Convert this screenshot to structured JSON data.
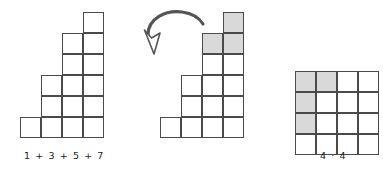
{
  "page": {
    "width": 383,
    "height": 172,
    "background": "#ffffff"
  },
  "style": {
    "cell_size": 21,
    "cell_border_color": "#4a4a4a",
    "cell_fill_plain": "#ffffff",
    "cell_fill_shaded": "#d9d9d9",
    "caption_color": "#1a1a1a",
    "arrow_color": "#555555"
  },
  "figures": [
    {
      "id": "staircase-plain",
      "name": "odd-number-staircase",
      "origin": {
        "x": 20,
        "y": 12
      },
      "columns": 4,
      "rows": 6,
      "column_heights": [
        1,
        3,
        5,
        6
      ],
      "cells": [
        {
          "col": 0,
          "row": 5,
          "shaded": false
        },
        {
          "col": 1,
          "row": 3,
          "shaded": false
        },
        {
          "col": 1,
          "row": 4,
          "shaded": false
        },
        {
          "col": 1,
          "row": 5,
          "shaded": false
        },
        {
          "col": 2,
          "row": 1,
          "shaded": false
        },
        {
          "col": 2,
          "row": 2,
          "shaded": false
        },
        {
          "col": 2,
          "row": 3,
          "shaded": false
        },
        {
          "col": 2,
          "row": 4,
          "shaded": false
        },
        {
          "col": 2,
          "row": 5,
          "shaded": false
        },
        {
          "col": 3,
          "row": 0,
          "shaded": false
        },
        {
          "col": 3,
          "row": 1,
          "shaded": false
        },
        {
          "col": 3,
          "row": 2,
          "shaded": false
        },
        {
          "col": 3,
          "row": 3,
          "shaded": false
        },
        {
          "col": 3,
          "row": 4,
          "shaded": false
        },
        {
          "col": 3,
          "row": 5,
          "shaded": false
        }
      ],
      "caption": {
        "text": "1 + 3 + 5 + 7",
        "x": 24,
        "y": 150
      }
    },
    {
      "id": "staircase-shaded",
      "name": "odd-number-staircase-highlighted",
      "origin": {
        "x": 160,
        "y": 12
      },
      "columns": 4,
      "rows": 6,
      "column_heights": [
        1,
        3,
        5,
        6
      ],
      "cells": [
        {
          "col": 0,
          "row": 5,
          "shaded": false
        },
        {
          "col": 1,
          "row": 3,
          "shaded": false
        },
        {
          "col": 1,
          "row": 4,
          "shaded": false
        },
        {
          "col": 1,
          "row": 5,
          "shaded": false
        },
        {
          "col": 2,
          "row": 1,
          "shaded": true
        },
        {
          "col": 2,
          "row": 2,
          "shaded": false
        },
        {
          "col": 2,
          "row": 3,
          "shaded": false
        },
        {
          "col": 2,
          "row": 4,
          "shaded": false
        },
        {
          "col": 2,
          "row": 5,
          "shaded": false
        },
        {
          "col": 3,
          "row": 0,
          "shaded": true
        },
        {
          "col": 3,
          "row": 1,
          "shaded": true
        },
        {
          "col": 3,
          "row": 2,
          "shaded": false
        },
        {
          "col": 3,
          "row": 3,
          "shaded": false
        },
        {
          "col": 3,
          "row": 4,
          "shaded": false
        },
        {
          "col": 3,
          "row": 5,
          "shaded": false
        }
      ],
      "caption": null
    },
    {
      "id": "square-grid",
      "name": "four-by-four-square",
      "origin": {
        "x": 295,
        "y": 71
      },
      "columns": 4,
      "rows": 4,
      "column_heights": [
        4,
        4,
        4,
        4
      ],
      "cells": [
        {
          "col": 0,
          "row": 0,
          "shaded": true
        },
        {
          "col": 1,
          "row": 0,
          "shaded": true
        },
        {
          "col": 2,
          "row": 0,
          "shaded": false
        },
        {
          "col": 3,
          "row": 0,
          "shaded": false
        },
        {
          "col": 0,
          "row": 1,
          "shaded": true
        },
        {
          "col": 1,
          "row": 1,
          "shaded": false
        },
        {
          "col": 2,
          "row": 1,
          "shaded": false
        },
        {
          "col": 3,
          "row": 1,
          "shaded": false
        },
        {
          "col": 0,
          "row": 2,
          "shaded": true
        },
        {
          "col": 1,
          "row": 2,
          "shaded": false
        },
        {
          "col": 2,
          "row": 2,
          "shaded": false
        },
        {
          "col": 3,
          "row": 2,
          "shaded": false
        },
        {
          "col": 0,
          "row": 3,
          "shaded": false
        },
        {
          "col": 1,
          "row": 3,
          "shaded": false
        },
        {
          "col": 2,
          "row": 3,
          "shaded": false
        },
        {
          "col": 3,
          "row": 3,
          "shaded": false
        }
      ],
      "caption": {
        "text": "4 · 4",
        "x": 320,
        "y": 150
      }
    }
  ],
  "annotations": {
    "arrow": {
      "name": "rotation-arrow",
      "direction": "curved-down-left",
      "color": "#555555"
    }
  }
}
